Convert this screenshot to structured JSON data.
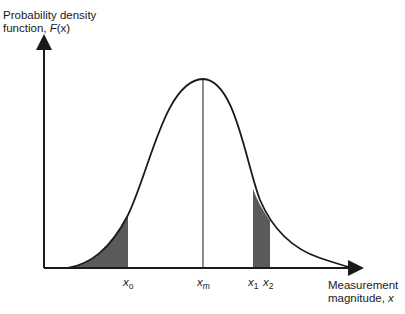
{
  "diagram": {
    "y_axis": {
      "label_line1": "Probability density",
      "label_line2_prefix": "function, ",
      "label_line2_var": "F",
      "label_line2_suffix": "(x)"
    },
    "x_axis": {
      "label_line1": "Measurement",
      "label_line2_prefix": "magnitude, ",
      "label_line2_var": "x"
    },
    "markers": [
      {
        "id": "x0",
        "var": "x",
        "sub": "o",
        "description": "lower bound of left tail shaded area"
      },
      {
        "id": "xm",
        "var": "x",
        "sub": "m",
        "description": "mean / peak of distribution"
      },
      {
        "id": "x1",
        "var": "x",
        "sub": "1",
        "description": "left edge of shaded band"
      },
      {
        "id": "x2",
        "var": "x",
        "sub": "2",
        "description": "right edge of shaded band"
      }
    ],
    "shaded_regions": [
      {
        "from": "-inf",
        "to": "x0",
        "color": "#555555"
      },
      {
        "from": "x1",
        "to": "x2",
        "color": "#555555"
      }
    ],
    "colors": {
      "line": "#1a1a1a",
      "shade": "#5a5a5a",
      "background": "#ffffff"
    }
  }
}
